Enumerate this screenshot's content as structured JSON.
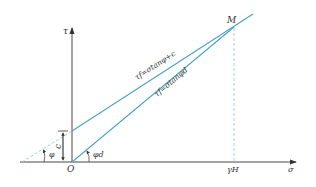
{
  "diagram": {
    "axes": {
      "y_label": "τ",
      "x_label": "σ",
      "origin_label": "O"
    },
    "lines": [
      {
        "label": "τf=σtanφ+c",
        "description": "shear strength line with cohesion"
      },
      {
        "label": "τf=σtanφd",
        "description": "developed strength line through origin"
      }
    ],
    "points": {
      "intersection_label": "M",
      "x_marker_label": "γH"
    },
    "annotations": {
      "cohesion_label": "c",
      "friction_angle_label": "φ",
      "developed_angle_label": "φd"
    },
    "colors": {
      "line": "#4aa3c8",
      "axis": "#333333",
      "dashed": "#9ccbe0"
    }
  }
}
